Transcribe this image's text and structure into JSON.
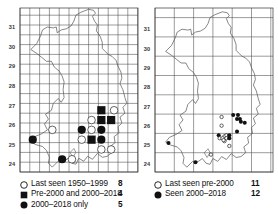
{
  "left_map": {
    "y_ticks": [
      "31",
      "30",
      "29",
      "28",
      "27",
      "26",
      "25",
      "24"
    ],
    "x_ticks": [
      "52",
      "53",
      "54",
      "55",
      "56",
      "57"
    ],
    "grid": "tetrad",
    "markers": [
      {
        "type": "open",
        "x": 56.4,
        "y": 26.75
      },
      {
        "type": "square",
        "x": 55.75,
        "y": 26.75
      },
      {
        "type": "open",
        "x": 55.25,
        "y": 26.25
      },
      {
        "type": "square",
        "x": 55.75,
        "y": 26.25
      },
      {
        "type": "square",
        "x": 56.25,
        "y": 26.25
      },
      {
        "type": "open",
        "x": 53.25,
        "y": 25.75
      },
      {
        "type": "filled",
        "x": 54.75,
        "y": 25.75
      },
      {
        "type": "open",
        "x": 55.25,
        "y": 25.75
      },
      {
        "type": "filled",
        "x": 55.75,
        "y": 25.75
      },
      {
        "type": "filled",
        "x": 52.25,
        "y": 25.25
      },
      {
        "type": "open",
        "x": 54.75,
        "y": 25.25
      },
      {
        "type": "square",
        "x": 55.25,
        "y": 25.25
      },
      {
        "type": "filled",
        "x": 55.75,
        "y": 25.25
      },
      {
        "type": "open",
        "x": 55.75,
        "y": 24.75
      },
      {
        "type": "open",
        "x": 56.25,
        "y": 24.75
      },
      {
        "type": "filled",
        "x": 53.75,
        "y": 24.25
      },
      {
        "type": "open",
        "x": 54.25,
        "y": 24.25
      }
    ],
    "legend": [
      {
        "symbol": "open-circle",
        "label": "Last seen 1950–1999",
        "count": "8"
      },
      {
        "symbol": "filled-square",
        "label": "Pre-2000 and 2000–2018",
        "count": "4"
      },
      {
        "symbol": "filled-circle",
        "label": "2000–2018 only",
        "count": "5"
      }
    ]
  },
  "right_map": {
    "y_ticks": [
      "31",
      "30",
      "29",
      "28",
      "27",
      "26",
      "25",
      "24"
    ],
    "x_ticks": [
      "52",
      "53",
      "54",
      "55",
      "56",
      "57"
    ],
    "grid": "10km",
    "markers": [
      {
        "type": "filled",
        "x": 55.65,
        "y": 26.55
      },
      {
        "type": "filled",
        "x": 55.9,
        "y": 26.55
      },
      {
        "type": "filled",
        "x": 55.85,
        "y": 26.35
      },
      {
        "type": "filled",
        "x": 56.0,
        "y": 26.35
      },
      {
        "type": "filled",
        "x": 56.05,
        "y": 26.2
      },
      {
        "type": "filled",
        "x": 56.25,
        "y": 26.15
      },
      {
        "type": "open",
        "x": 55.05,
        "y": 26.45
      },
      {
        "type": "open",
        "x": 55.05,
        "y": 26.0
      },
      {
        "type": "filled",
        "x": 55.85,
        "y": 25.7
      },
      {
        "type": "filled",
        "x": 54.9,
        "y": 25.5
      },
      {
        "type": "open",
        "x": 55.2,
        "y": 25.45
      },
      {
        "type": "open",
        "x": 55.3,
        "y": 25.5
      },
      {
        "type": "filled",
        "x": 55.45,
        "y": 25.5
      },
      {
        "type": "open",
        "x": 54.95,
        "y": 25.35
      },
      {
        "type": "open",
        "x": 55.1,
        "y": 25.35
      },
      {
        "type": "open",
        "x": 55.3,
        "y": 25.35
      },
      {
        "type": "filled",
        "x": 55.45,
        "y": 25.35
      },
      {
        "type": "open",
        "x": 55.2,
        "y": 25.2
      },
      {
        "type": "open",
        "x": 55.45,
        "y": 24.95
      },
      {
        "type": "open",
        "x": 54.5,
        "y": 24.5
      },
      {
        "type": "filled",
        "x": 52.3,
        "y": 25.1
      },
      {
        "type": "filled",
        "x": 53.7,
        "y": 24.1
      },
      {
        "type": "open",
        "x": 55.15,
        "y": 25.25
      }
    ],
    "legend": [
      {
        "symbol": "open-circle",
        "label": "Last seen pre-2000",
        "count": "11"
      },
      {
        "symbol": "filled-circle",
        "label": "Seen 2000–2018",
        "count": "12"
      }
    ]
  },
  "colors": {
    "line": "#444444",
    "grid": "#555555",
    "marker": "#111111",
    "coast": "#666666"
  }
}
